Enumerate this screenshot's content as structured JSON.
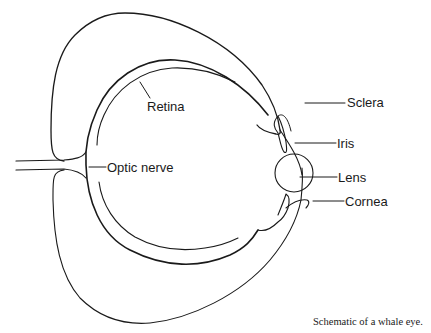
{
  "diagram": {
    "title": "Schematic of a whale eye.",
    "colors": {
      "line": "#1a1a1a",
      "background": "#ffffff"
    },
    "labels": {
      "retina": "Retina",
      "optic_nerve": "Optic nerve",
      "sclera": "Sclera",
      "iris": "Iris",
      "lens": "Lens",
      "cornea": "Cornea"
    },
    "caption": "Schematic of a whale eye."
  }
}
